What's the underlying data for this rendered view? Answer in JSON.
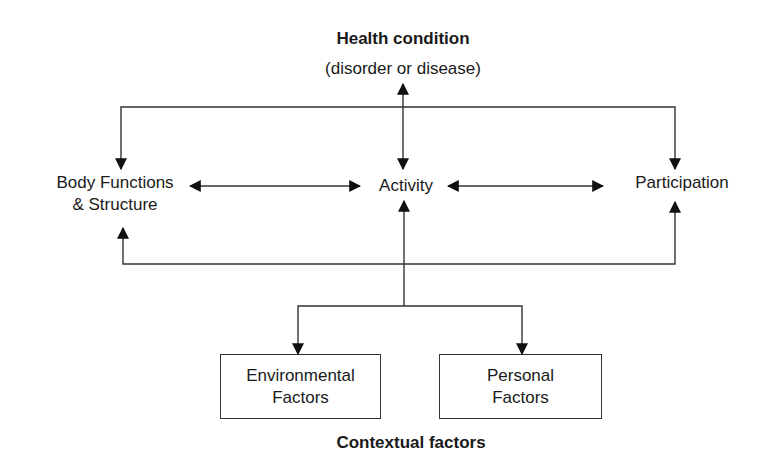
{
  "diagram": {
    "top": {
      "title": "Health condition",
      "subtitle": "(disorder or disease)"
    },
    "middle": {
      "left": {
        "line1": "Body Functions",
        "line2": "& Structure"
      },
      "center": {
        "label": "Activity"
      },
      "right": {
        "label": "Participation"
      }
    },
    "bottom": {
      "boxes": [
        {
          "line1": "Environmental",
          "line2": "Factors"
        },
        {
          "line1": "Personal",
          "line2": "Factors"
        }
      ],
      "caption": "Contextual factors"
    },
    "colors": {
      "line": "#222222",
      "text": "#1a1a1a",
      "background": "#ffffff"
    }
  }
}
